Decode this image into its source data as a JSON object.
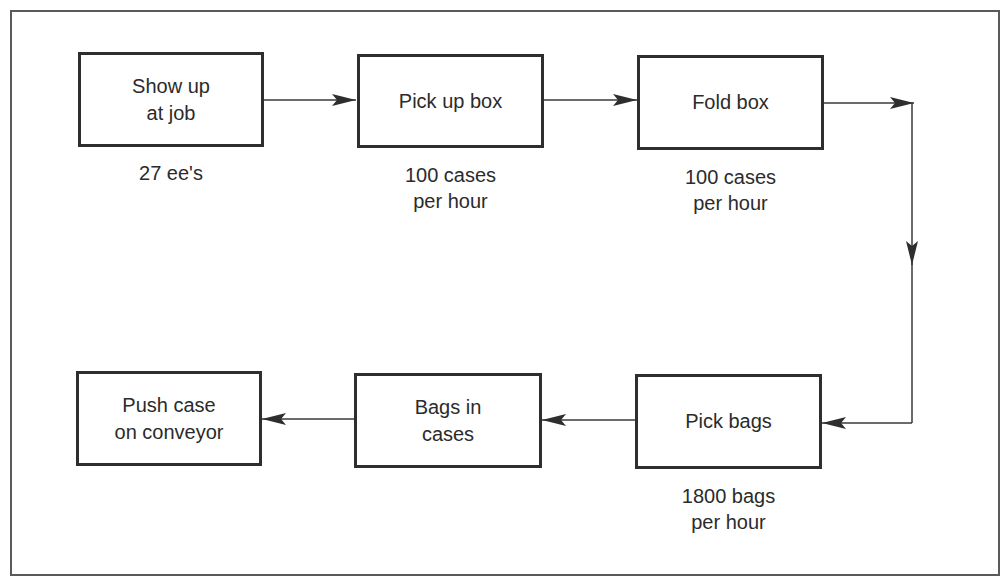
{
  "diagram": {
    "type": "process-flow",
    "colors": {
      "line": "#2e2e2e",
      "text": "#2b2b2b",
      "border": "#5a5a5a"
    },
    "steps": [
      {
        "id": "show-up",
        "label": "Show up\nat job",
        "note": "27 ee's"
      },
      {
        "id": "pick-up-box",
        "label": "Pick up box",
        "note": "100 cases\nper hour"
      },
      {
        "id": "fold-box",
        "label": "Fold box",
        "note": "100 cases\nper hour"
      },
      {
        "id": "pick-bags",
        "label": "Pick bags",
        "note": "1800 bags\nper hour"
      },
      {
        "id": "bags-in-cases",
        "label": "Bags in\ncases",
        "note": ""
      },
      {
        "id": "push-case",
        "label": "Push case\non conveyor",
        "note": ""
      }
    ],
    "edges": [
      {
        "from": "show-up",
        "to": "pick-up-box"
      },
      {
        "from": "pick-up-box",
        "to": "fold-box"
      },
      {
        "from": "fold-box",
        "to": "pick-bags"
      },
      {
        "from": "pick-bags",
        "to": "bags-in-cases"
      },
      {
        "from": "bags-in-cases",
        "to": "push-case"
      }
    ]
  }
}
